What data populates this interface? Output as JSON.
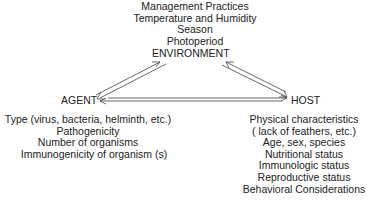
{
  "diagram": {
    "nodes": {
      "environment": {
        "label": "ENVIRONMENT",
        "factors": [
          "Management Practices",
          "Temperature and Humidity",
          "Season",
          "Photoperiod"
        ]
      },
      "agent": {
        "label": "AGENT",
        "factors": [
          "Type (virus, bacteria, helminth, etc.)",
          "Pathogenicity",
          "Number of organisms",
          "Immunogenicity of organism (s)"
        ]
      },
      "host": {
        "label": "HOST",
        "factors": [
          "Physical characteristics",
          "( lack of feathers, etc.)",
          "Age, sex, species",
          "Nutritional status",
          "Immunologic status",
          "Reproductive status",
          "Behavioral Considerations"
        ]
      }
    },
    "edges": [
      {
        "from": "AGENT",
        "to": "ENVIRONMENT",
        "style": "double-line-arrow"
      },
      {
        "from": "ENVIRONMENT",
        "to": "AGENT",
        "style": "double-line-arrow"
      },
      {
        "from": "HOST",
        "to": "ENVIRONMENT",
        "style": "double-line-arrow"
      },
      {
        "from": "ENVIRONMENT",
        "to": "HOST",
        "style": "double-line-arrow"
      },
      {
        "from": "AGENT",
        "to": "HOST",
        "style": "double-line-arrow"
      },
      {
        "from": "HOST",
        "to": "AGENT",
        "style": "double-line-arrow"
      }
    ],
    "colors": {
      "text": "#222222",
      "lines": "#444444",
      "background": "#ffffff"
    }
  }
}
